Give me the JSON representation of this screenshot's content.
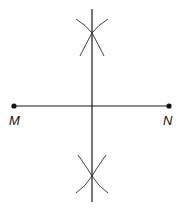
{
  "diagram": {
    "points": [
      {
        "id": "M",
        "label": "M"
      },
      {
        "id": "N",
        "label": "N"
      }
    ],
    "segments": [
      {
        "from": "M",
        "to": "N",
        "name": "segment MN"
      }
    ],
    "construction": {
      "type": "perpendicular-bisector",
      "of": "MN",
      "arc_intersections": [
        "above MN",
        "below MN"
      ]
    },
    "colors": {
      "line": "#1a1a1a",
      "background": "#ffffff"
    }
  }
}
